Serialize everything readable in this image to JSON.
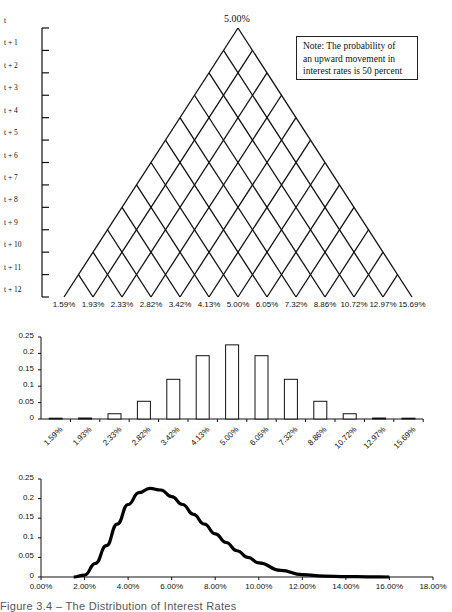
{
  "chart_data": [
    {
      "type": "diagram",
      "title": "Binomial interest rate lattice",
      "apex_label": "5.00%",
      "time_labels": [
        "t",
        "t + 1",
        "t + 2",
        "t + 3",
        "t + 4",
        "t + 5",
        "t + 6",
        "t + 7",
        "t + 8",
        "t + 9",
        "t + 10",
        "t + 11",
        "t + 12"
      ],
      "terminal_rates": [
        "1.59%",
        "1.93%",
        "2.33%",
        "2.82%",
        "3.42%",
        "4.13%",
        "5.00%",
        "6.05%",
        "7.32%",
        "8.86%",
        "10.72%",
        "12.97%",
        "15.69%"
      ],
      "steps": 12,
      "note": [
        "Note: The probability of",
        "an upward movement in",
        "interest rates is 50 percent"
      ]
    },
    {
      "type": "bar",
      "categories": [
        "1.59%",
        "1.93%",
        "2.33%",
        "2.82%",
        "3.42%",
        "4.13%",
        "5.00%",
        "6.05%",
        "7.32%",
        "8.86%",
        "10.72%",
        "12.97%",
        "15.69%"
      ],
      "values": [
        0.0002,
        0.003,
        0.016,
        0.054,
        0.121,
        0.193,
        0.226,
        0.193,
        0.121,
        0.054,
        0.016,
        0.003,
        0.0002
      ],
      "yticks": [
        "0.25",
        "0.2",
        "0.15",
        "0.1",
        "0.05",
        "0"
      ],
      "ylim": [
        0,
        0.25
      ],
      "xlabel": "",
      "ylabel": "",
      "grid": false
    },
    {
      "type": "line",
      "x": [
        1.5,
        2.0,
        2.5,
        3.0,
        3.5,
        4.0,
        4.5,
        5.0,
        5.5,
        6.0,
        6.5,
        7.0,
        7.5,
        8.0,
        8.5,
        9.0,
        9.5,
        10.0,
        11.0,
        12.0,
        13.0,
        14.0,
        15.0,
        16.0
      ],
      "values": [
        0.0,
        0.005,
        0.035,
        0.08,
        0.135,
        0.185,
        0.215,
        0.226,
        0.222,
        0.205,
        0.185,
        0.16,
        0.135,
        0.11,
        0.088,
        0.067,
        0.05,
        0.036,
        0.017,
        0.006,
        0.002,
        0.001,
        0.0005,
        0.0
      ],
      "xticks": [
        "0.00%",
        "2.00%",
        "4.00%",
        "6.00%",
        "8.00%",
        "10.00%",
        "12.00%",
        "14.00%",
        "16.00%",
        "18.00%"
      ],
      "yticks": [
        "0.25",
        "0.2",
        "0.15",
        "0.1",
        "0.05",
        "0"
      ],
      "xlim": [
        0,
        18
      ],
      "ylim": [
        0,
        0.25
      ],
      "grid": false
    }
  ],
  "caption": "Figure 3.4 – The Distribution of Interest Rates"
}
